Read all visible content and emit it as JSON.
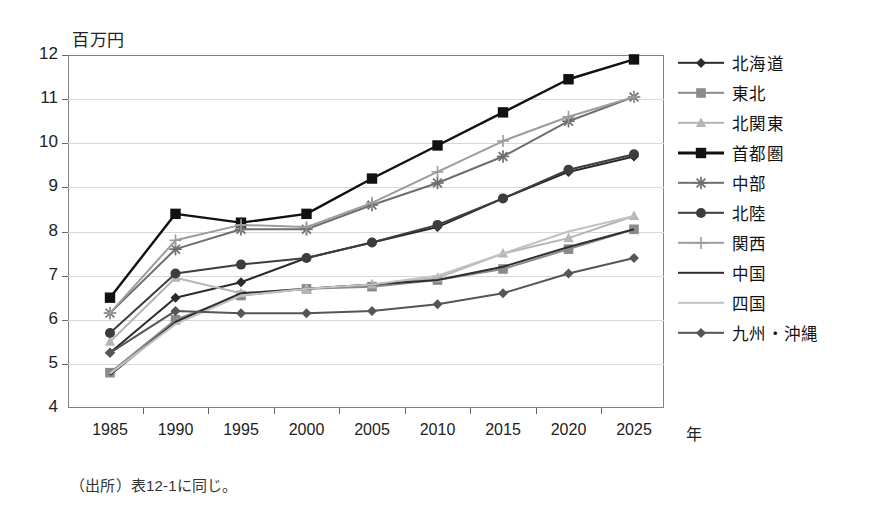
{
  "ylabel_text": "百万円",
  "xaxis_title": "年",
  "caption": "（出所）表12-1に同じ。",
  "chart_data": {
    "type": "line",
    "title": "",
    "xlabel": "年",
    "ylabel": "百万円",
    "x": [
      1985,
      1990,
      1995,
      2000,
      2005,
      2010,
      2015,
      2020,
      2025
    ],
    "xtick_labels": [
      "1985",
      "1990",
      "1995",
      "2000",
      "2005",
      "2010",
      "2015",
      "2020",
      "2025"
    ],
    "ytick_labels": [
      "12",
      "11",
      "10",
      "9",
      "8",
      "7",
      "6",
      "5",
      "4"
    ],
    "ylim": [
      4,
      12
    ],
    "ystep": 1,
    "grid": true,
    "legend_position": "right",
    "series": [
      {
        "name": "北海道",
        "marker": "diamond",
        "color": "#2b2b2b",
        "values": [
          5.25,
          6.5,
          6.85,
          7.4,
          7.75,
          8.1,
          8.75,
          9.35,
          9.7
        ]
      },
      {
        "name": "東北",
        "marker": "square",
        "color": "#8a8a8a",
        "values": [
          4.8,
          6.0,
          6.55,
          6.7,
          6.75,
          6.9,
          7.15,
          7.6,
          8.05
        ]
      },
      {
        "name": "北関東",
        "marker": "triangle",
        "color": "#b5b5b5",
        "values": [
          5.5,
          6.95,
          6.6,
          6.7,
          6.8,
          6.95,
          7.5,
          7.85,
          8.35
        ]
      },
      {
        "name": "首都圏",
        "marker": "square-filled",
        "color": "#111111",
        "values": [
          6.5,
          8.4,
          8.2,
          8.4,
          9.2,
          9.95,
          10.7,
          11.45,
          11.9
        ]
      },
      {
        "name": "中部",
        "marker": "asterisk",
        "color": "#6e6e6e",
        "values": [
          6.15,
          7.6,
          8.05,
          8.05,
          8.6,
          9.1,
          9.7,
          10.5,
          11.05
        ]
      },
      {
        "name": "北陸",
        "marker": "circle",
        "color": "#3d3d3d",
        "values": [
          5.7,
          7.05,
          7.25,
          7.4,
          7.75,
          8.15,
          8.75,
          9.4,
          9.75
        ]
      },
      {
        "name": "関西",
        "marker": "plus",
        "color": "#9c9c9c",
        "values": [
          6.15,
          7.8,
          8.15,
          8.1,
          8.65,
          9.35,
          10.05,
          10.6,
          11.05
        ]
      },
      {
        "name": "中国",
        "marker": "none",
        "color": "#2f2f2f",
        "values": [
          4.75,
          5.95,
          6.6,
          6.7,
          6.8,
          6.9,
          7.2,
          7.65,
          8.05
        ]
      },
      {
        "name": "四国",
        "marker": "none",
        "color": "#c2c2c2",
        "values": [
          4.78,
          5.9,
          6.55,
          6.7,
          6.8,
          7.0,
          7.5,
          8.0,
          8.35
        ]
      },
      {
        "name": "九州・沖縄",
        "marker": "diamond",
        "color": "#555555",
        "values": [
          5.25,
          6.2,
          6.15,
          6.15,
          6.2,
          6.35,
          6.6,
          7.05,
          7.4
        ]
      }
    ]
  }
}
